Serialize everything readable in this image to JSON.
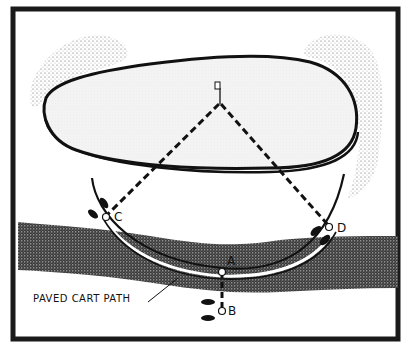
{
  "diagram": {
    "title": "",
    "labels": {
      "point_a": "A",
      "point_b": "B",
      "point_c": "C",
      "point_d": "D",
      "path_caption": "PAVED CART PATH"
    },
    "elements": {
      "green": "putting green (oval, light dotted fill)",
      "flag": "flagstick on green",
      "bunkers": [
        "top-left stippled area",
        "right stippled area"
      ],
      "rough_band": "dark stippled band crossing lower area",
      "cart_path": "curved paved cart path around green",
      "footprints": [
        "near C",
        "near D",
        "near B"
      ],
      "dashed_lines": [
        "flag to C",
        "flag to D",
        "A to B"
      ]
    },
    "colors": {
      "frame": "#1a1a1a",
      "green_fill": "#f1f1f1",
      "stipple": "#333333",
      "background": "#ffffff"
    }
  }
}
